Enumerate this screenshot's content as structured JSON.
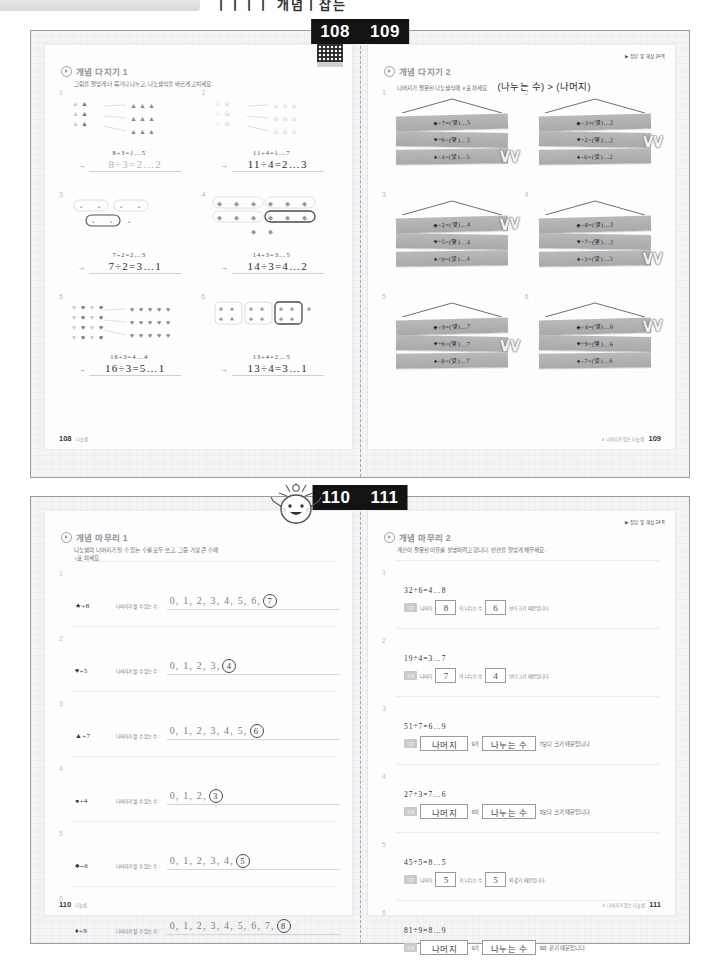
{
  "header": {
    "title": "ㅣㅣㅣㅣ 개념ㅣ잡는"
  },
  "spread1": {
    "banner": {
      "left_page": "108",
      "right_page": "109"
    },
    "left": {
      "section_title": "개념 다지기 1",
      "instruction": "그림을 알맞게 더 묶거나 나누고, 나눗셈식을 바르게 고치세요.",
      "qr_label": "QR",
      "footer_page": "108",
      "footer_text": "나눗셈",
      "problems": [
        {
          "num": "1",
          "shape": "triangle",
          "given": "8÷3=1…5",
          "answer": "8÷3=2…2",
          "faded": true
        },
        {
          "num": "2",
          "shape": "star",
          "given": "11÷4=1…7",
          "answer": "11÷4=2…3",
          "faded": false
        },
        {
          "num": "3",
          "shape": "square",
          "given": "7÷2=2…3",
          "answer": "7÷2=3…1",
          "faded": false
        },
        {
          "num": "4",
          "shape": "diamond",
          "given": "14÷3=3…5",
          "answer": "14÷3=4…2",
          "faded": false
        },
        {
          "num": "5",
          "shape": "heart",
          "given": "16÷3=4…4",
          "answer": "16÷3=5…1",
          "faded": false
        },
        {
          "num": "6",
          "shape": "club",
          "given": "13÷4=2…5",
          "answer": "13÷4=3…1",
          "faded": false
        }
      ]
    },
    "right": {
      "section_title": "개념 다지기 2",
      "instruction": "나머지가 잘못된 나눗셈식에 ∨표 하세요.",
      "hint": "(나누는 수) > (나머지)",
      "answer_note": "▶ 정답 및 해설 24쪽",
      "footer_page": "109",
      "footer_text": "3. 나머지가 있는 나눗셈",
      "problems": [
        {
          "num": "1",
          "planks": [
            "♣÷7=(몇)…5",
            "♥÷6=(몇)…5",
            "♦÷4=(몇)…5"
          ],
          "checked": [
            2
          ]
        },
        {
          "num": "2",
          "planks": [
            "♣÷3=(몇)…2",
            "♥÷2=(몇)…2",
            "♦÷6=(몇)…2"
          ],
          "checked": [
            1
          ]
        },
        {
          "num": "3",
          "planks": [
            "♣÷2=(몇)…4",
            "♥÷5=(몇)…4",
            "♦÷9=(몇)…4"
          ],
          "checked": [
            0
          ]
        },
        {
          "num": "4",
          "planks": [
            "♣÷8=(몇)…3",
            "♥÷7=(몇)…3",
            "♦÷3=(몇)…3"
          ],
          "checked": [
            2
          ]
        },
        {
          "num": "5",
          "planks": [
            "♣÷9=(몇)…7",
            "♥÷6=(몇)…7",
            "♦÷8=(몇)…7"
          ],
          "checked": [
            1
          ]
        },
        {
          "num": "6",
          "planks": [
            "♣÷4=(몇)…6",
            "♥÷9=(몇)…6",
            "♦÷7=(몇)…6"
          ],
          "checked": [
            0
          ]
        }
      ]
    }
  },
  "spread2": {
    "banner": {
      "left_page": "110",
      "right_page": "111"
    },
    "left": {
      "section_title": "개념 마무리 1",
      "instruction_line1": "나눗셈의 나머지가 될 수 있는 수를 모두 쓰고, 그중 가장 큰 수에",
      "instruction_line2": "○표 하세요.",
      "row_label": "나머지가 될 수 있는 수 :",
      "footer_page": "110",
      "footer_text": "나눗셈",
      "problems": [
        {
          "num": "1",
          "expr": "★÷8",
          "values": "0, 1, 2, 3, 4, 5, 6,",
          "circled": "7"
        },
        {
          "num": "2",
          "expr": "♥÷5",
          "values": "0, 1, 2, 3,",
          "circled": "4"
        },
        {
          "num": "3",
          "expr": "▲÷7",
          "values": "0, 1, 2, 3, 4, 5,",
          "circled": "6"
        },
        {
          "num": "4",
          "expr": "●÷4",
          "values": "0, 1, 2,",
          "circled": "3"
        },
        {
          "num": "5",
          "expr": "♣÷6",
          "values": "0, 1, 2, 3, 4,",
          "circled": "5"
        },
        {
          "num": "6",
          "expr": "♦÷9",
          "values": "0, 1, 2, 3, 4, 5, 6, 7,",
          "circled": "8"
        }
      ]
    },
    "right": {
      "section_title": "개념 마무리 2",
      "instruction": "계산이 잘못된 이유를 설명하려고 합니다. 빈칸을 알맞게 채우세요.",
      "answer_note": "▶ 정답 및 해설 24쪽",
      "reason_tag": "이유",
      "footer_page": "111",
      "footer_text": "3. 나머지가 있는 나눗셈",
      "problems": [
        {
          "num": "1",
          "eq": "32÷6=4…8",
          "parts": [
            {
              "type": "text",
              "value": "나머지",
              "style": "small"
            },
            {
              "type": "blank",
              "value": "8"
            },
            {
              "type": "text",
              "value": "이 나누는 수",
              "style": "small"
            },
            {
              "type": "blank",
              "value": "6"
            },
            {
              "type": "text",
              "value": "보다 크기 때문입니다.",
              "style": "small"
            }
          ]
        },
        {
          "num": "2",
          "eq": "19÷4=3…7",
          "parts": [
            {
              "type": "text",
              "value": "나머지",
              "style": "small"
            },
            {
              "type": "blank",
              "value": "7"
            },
            {
              "type": "text",
              "value": "이 나누는 수",
              "style": "small"
            },
            {
              "type": "blank",
              "value": "4"
            },
            {
              "type": "text",
              "value": "보다 크기 때문입니다.",
              "style": "small"
            }
          ]
        },
        {
          "num": "3",
          "eq": "51÷7=6…9",
          "parts": [
            {
              "type": "blank-wide",
              "value": "나머지"
            },
            {
              "type": "text",
              "value": "9가",
              "style": "norm"
            },
            {
              "type": "blank-widest",
              "value": "나누는 수"
            },
            {
              "type": "text",
              "value": "7보다 크기 때문입니다",
              "style": "norm"
            }
          ]
        },
        {
          "num": "4",
          "eq": "27÷3=7…6",
          "parts": [
            {
              "type": "blank-wide",
              "value": "나머지"
            },
            {
              "type": "text",
              "value": "6이",
              "style": "norm"
            },
            {
              "type": "blank-widest",
              "value": "나누는 수"
            },
            {
              "type": "text",
              "value": "3보다 크기 때문입니다.",
              "style": "norm"
            }
          ]
        },
        {
          "num": "5",
          "eq": "45÷5=8…5",
          "parts": [
            {
              "type": "text",
              "value": "나머지",
              "style": "small"
            },
            {
              "type": "blank",
              "value": "5"
            },
            {
              "type": "text",
              "value": "가 나누는 수",
              "style": "small"
            },
            {
              "type": "blank",
              "value": "5"
            },
            {
              "type": "text",
              "value": "와 같기 때문입니다.",
              "style": "small"
            }
          ]
        },
        {
          "num": "6",
          "eq": "81÷9=8…9",
          "parts": [
            {
              "type": "blank-wide",
              "value": "나머지"
            },
            {
              "type": "text",
              "value": "9가",
              "style": "norm"
            },
            {
              "type": "blank-widest",
              "value": "나누는 수"
            },
            {
              "type": "text",
              "value": "9와 같기 때문입니다.",
              "style": "norm"
            }
          ]
        }
      ]
    }
  },
  "colors": {
    "banner_bg": "#131313",
    "plank": "#b1b1b3",
    "page_bg": "#f4f4f6",
    "paper": "#fdfdfd"
  }
}
